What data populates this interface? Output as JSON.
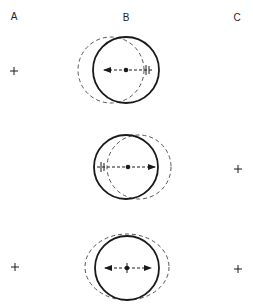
{
  "labels": {
    "a": "A",
    "b": "B",
    "c": "C"
  },
  "colors": {
    "stroke": "#1a1a1a",
    "dashed": "#555555",
    "background": "#ffffff"
  },
  "panels": [
    {
      "name": "top",
      "solid_circle": {
        "cx": 126,
        "cy": 70,
        "r": 33
      },
      "dashed_circle": {
        "cx": 111,
        "cy": 70,
        "rx": 33,
        "ry": 33
      },
      "dot": {
        "x": 126,
        "y": 70
      },
      "arrow": {
        "direction": "left",
        "from_x": 148,
        "to_x": 103
      },
      "tick_mark_x": 148,
      "reference_cross": {
        "column": "A",
        "x": 14,
        "y": 71
      }
    },
    {
      "name": "middle",
      "solid_circle": {
        "cx": 126,
        "cy": 167,
        "r": 32
      },
      "dashed_circle": {
        "cx": 139,
        "cy": 167,
        "rx": 32,
        "ry": 32
      },
      "dot": {
        "x": 128,
        "y": 167
      },
      "arrow": {
        "direction": "right",
        "from_x": 100,
        "to_x": 155
      },
      "tick_mark_x": 102,
      "reference_cross": {
        "column": "C",
        "x": 238,
        "y": 169
      }
    },
    {
      "name": "bottom",
      "solid_circle": {
        "cx": 127,
        "cy": 268,
        "r": 32
      },
      "dashed_circle": {
        "cx": 127,
        "cy": 267,
        "rx": 42,
        "ry": 33
      },
      "dot": {
        "x": 127,
        "y": 268
      },
      "arrow": {
        "direction": "both",
        "from_x": 105,
        "to_x": 151
      },
      "reference_crosses": [
        {
          "column": "A",
          "x": 15,
          "y": 267
        },
        {
          "column": "C",
          "x": 238,
          "y": 269
        }
      ]
    }
  ]
}
